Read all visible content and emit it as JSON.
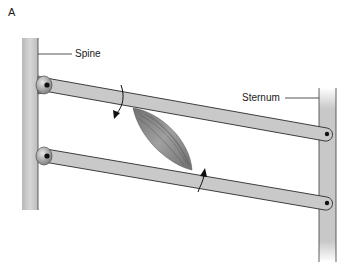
{
  "figure": {
    "panel_label": "A",
    "labels": {
      "spine": "Spine",
      "sternum": "Sternum"
    },
    "components": [
      {
        "name": "spine",
        "kind": "vertical-post",
        "side": "left"
      },
      {
        "name": "sternum",
        "kind": "vertical-post",
        "side": "right"
      },
      {
        "name": "upper-rib",
        "kind": "lever-bar",
        "from": "spine",
        "to": "sternum"
      },
      {
        "name": "lower-rib",
        "kind": "lever-bar",
        "from": "spine",
        "to": "sternum"
      },
      {
        "name": "muscle",
        "kind": "fusiform-muscle",
        "spans": [
          "upper-rib",
          "lower-rib"
        ]
      },
      {
        "name": "rotation-arrow-upper",
        "kind": "curved-arrow",
        "direction": "down"
      },
      {
        "name": "rotation-arrow-lower",
        "kind": "curved-arrow",
        "direction": "up"
      }
    ],
    "colors": {
      "post_fill": "#c4c4c4",
      "bar_fill": "#c9c9c9",
      "outline": "#2a2a2a",
      "muscle": "#8a8a8a",
      "text": "#1a1a1a"
    }
  }
}
